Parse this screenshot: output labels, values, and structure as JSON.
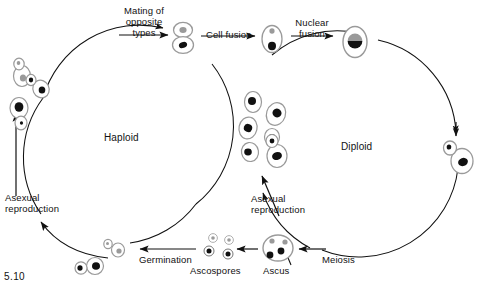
{
  "figure": {
    "number": "5.10",
    "width": 485,
    "height": 286
  },
  "colors": {
    "stroke": "#111111",
    "cell_outline": "#8c8c8c",
    "nucleus_dark": "#111111",
    "nucleus_light": "#9a9a9a",
    "background": "#ffffff"
  },
  "labels": {
    "mating": "Mating of\nopposite\ntypes",
    "cell_fusion": "Cell fusion",
    "nuclear_fusion": "Nuclear\nfusion",
    "haploid": "Haploid",
    "diploid": "Diploid",
    "asexual_left": "Asexual\nreproduction",
    "asexual_right": "Asexual\nreproduction",
    "germination": "Germination",
    "ascospores": "Ascospores",
    "ascus": "Ascus",
    "meiosis": "Meiosis"
  },
  "diagram_data": {
    "type": "cycle-diagram",
    "subject": "Yeast (Saccharomyces) life cycle",
    "cycles": [
      {
        "name": "Haploid",
        "center_label": "Haploid",
        "direction": "clockwise",
        "nodes": [
          "haploid budding cells",
          "mating of opposite types"
        ]
      },
      {
        "name": "Diploid",
        "center_label": "Diploid",
        "direction": "clockwise",
        "nodes": [
          "zygote",
          "diploid budding cells",
          "meiosis",
          "ascus"
        ]
      }
    ],
    "stages": [
      {
        "id": "haploid-cells",
        "label": "Haploid cells",
        "nucleus": "mixed"
      },
      {
        "id": "mating-pair",
        "label": "Mating of opposite types",
        "nucleus": "two"
      },
      {
        "id": "cell-fusion",
        "label": "Cell fusion",
        "nucleus": "two"
      },
      {
        "id": "nuclear-fusion",
        "label": "Nuclear fusion",
        "nucleus": "fused"
      },
      {
        "id": "zygote",
        "label": "Diploid zygote",
        "nucleus": "fused"
      },
      {
        "id": "diploid-cells",
        "label": "Diploid budding cells",
        "nucleus": "dark"
      },
      {
        "id": "meiosis",
        "label": "Meiosis",
        "nucleus": "four"
      },
      {
        "id": "ascus",
        "label": "Ascus",
        "spores": 4
      },
      {
        "id": "ascospores",
        "label": "Ascospores",
        "spores": 4
      },
      {
        "id": "germination",
        "label": "Germination",
        "nucleus": "mixed"
      }
    ],
    "spore_counts": {
      "ascus": 4,
      "ascospores": 4,
      "dark": 2,
      "light": 2
    }
  }
}
